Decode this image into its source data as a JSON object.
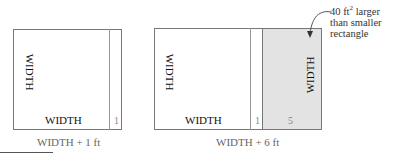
{
  "left_figure": {
    "width_side_label": "WIDTH",
    "width_bottom_label": "WIDTH",
    "extra_strip_label": "1",
    "caption": "WIDTH + 1 ft"
  },
  "right_figure": {
    "width_side_label": "WIDTH",
    "width_bottom_label": "WIDTH",
    "extra_strip_label": "1",
    "shaded_strip_label": "5",
    "shaded_side_label": "WIDTH",
    "caption": "WIDTH + 6 ft",
    "shaded_color": "#e3e3e3"
  },
  "annotation": {
    "line1_prefix": "40 ft",
    "line1_sup": "2",
    "line1_suffix": " larger",
    "line2": "than smaller",
    "line3": "rectangle"
  }
}
